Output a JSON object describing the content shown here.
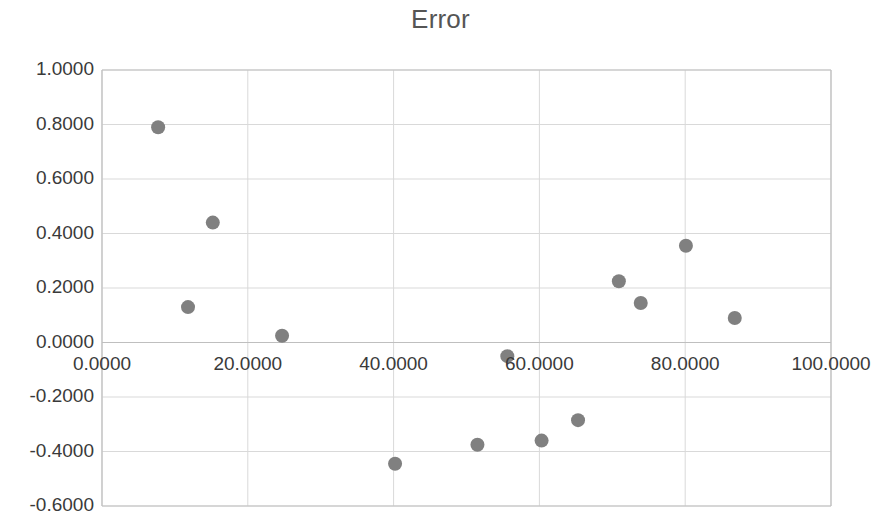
{
  "chart_data": {
    "type": "scatter",
    "title": "Error",
    "xlabel": "",
    "ylabel": "",
    "xlim": [
      0,
      100
    ],
    "ylim": [
      -0.6,
      1.0
    ],
    "xticks": [
      0,
      20,
      40,
      60,
      80,
      100
    ],
    "yticks": [
      -0.6,
      -0.4,
      -0.2,
      0.0,
      0.2,
      0.4,
      0.6,
      0.8,
      1.0
    ],
    "xtick_labels": [
      "0.0000",
      "20.0000",
      "40.0000",
      "60.0000",
      "80.0000",
      "100.0000"
    ],
    "ytick_labels": [
      "-0.6000",
      "-0.4000",
      "-0.2000",
      "0.0000",
      "0.2000",
      "0.4000",
      "0.6000",
      "0.8000",
      "1.0000"
    ],
    "grid": true,
    "legend": false,
    "marker_color": "#808080",
    "marker_size": 14,
    "series": [
      {
        "name": "Error",
        "points": [
          [
            7.7,
            0.79
          ],
          [
            11.8,
            0.13
          ],
          [
            15.2,
            0.44
          ],
          [
            24.7,
            0.025
          ],
          [
            40.2,
            -0.445
          ],
          [
            51.5,
            -0.375
          ],
          [
            55.6,
            -0.05
          ],
          [
            60.3,
            -0.36
          ],
          [
            65.3,
            -0.285
          ],
          [
            70.9,
            0.225
          ],
          [
            73.9,
            0.145
          ],
          [
            80.1,
            0.355
          ],
          [
            86.8,
            0.09
          ]
        ]
      }
    ]
  },
  "colors": {
    "marker": "#808080",
    "grid": "#d9d9d9",
    "axis": "#bfbfbf",
    "title_text": "#555555",
    "tick_text": "#3a3a3a",
    "background": "#ffffff"
  },
  "plot_geometry": {
    "left": 102,
    "right": 831,
    "top": 70,
    "bottom": 506
  }
}
